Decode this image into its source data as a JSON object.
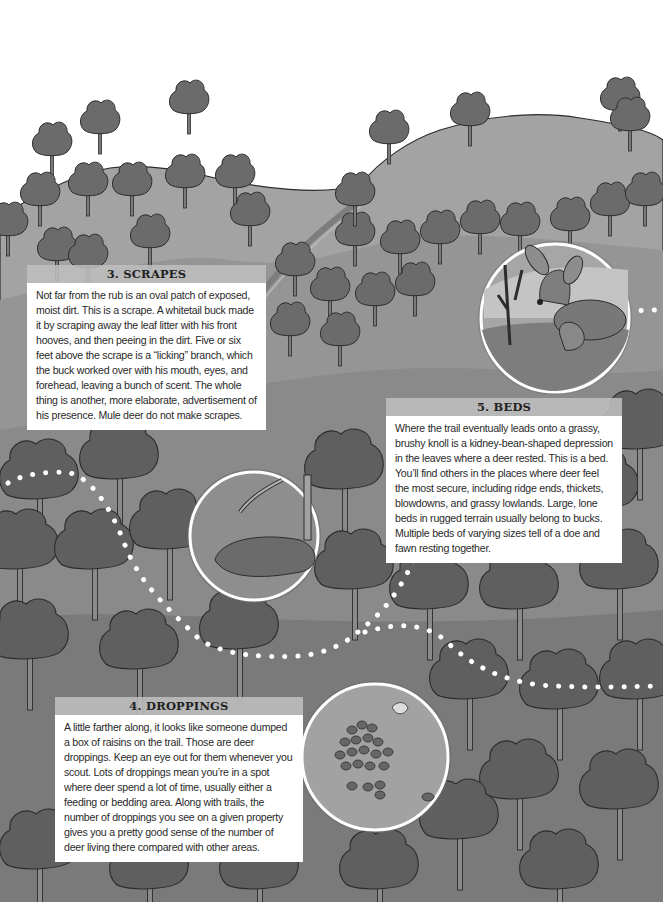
{
  "page": {
    "type": "illustrated field guide spread",
    "palette": {
      "sky": "#ffffff",
      "hill": "#9c9c9c",
      "hill_far": "#a9a9a9",
      "forest_floor": "#8a8a8a",
      "tree": "#6b6b6b",
      "tree_dark": "#555555",
      "outline": "#2c2c2c",
      "trail_dots": "#ffffff",
      "callout_header": "#bdbdbd",
      "callout_body": "#ffffff",
      "text": "#2a2a2a"
    }
  },
  "callouts": {
    "scrapes": {
      "title": "3. SCRAPES",
      "text": "Not far from the rub is an oval patch of exposed, moist dirt. This is a scrape. A whitetail buck made it by scraping away the leaf litter with his front hooves, and then peeing in the dirt. Five or six feet above the scrape is a “licking” branch, which the buck worked over with his mouth, eyes, and forehead, leaving a bunch of scent. The whole thing is another, more elaborate, advertisement of his presence. Mule deer do not make scrapes."
    },
    "beds": {
      "title": "5. BEDS",
      "text": "Where the trail eventually leads onto a grassy, brushy knoll is a kidney-bean-shaped depression in the leaves where a deer rested. This is a bed. You’ll find others in the places where deer feel the most secure, including ridge ends, thickets, blowdowns, and grassy lowlands. Large, lone beds in rugged terrain usually belong to bucks. Multiple beds of varying sizes tell of a doe and fawn resting together."
    },
    "droppings": {
      "title": "4. DROPPINGS",
      "text": "A little farther along, it looks like someone dumped a box of raisins on the trail. Those are deer droppings. Keep an eye out for them whenever you scout. Lots of droppings mean you’re in a spot where deer spend a lot of time, usually either a feeding or bedding area. Along with trails, the number of droppings you see on a given property gives you a pretty good sense of the number of deer living there compared with other areas."
    }
  },
  "insets": [
    {
      "name": "beds-inset",
      "depicts": "doe and fawn bedded in grass",
      "cx": 555,
      "cy": 318,
      "r": 74
    },
    {
      "name": "scrapes-inset",
      "depicts": "scrape under licking branch",
      "cx": 254,
      "cy": 536,
      "r": 64
    },
    {
      "name": "droppings-inset",
      "depicts": "pile of deer droppings",
      "cx": 375,
      "cy": 757,
      "r": 73
    }
  ]
}
